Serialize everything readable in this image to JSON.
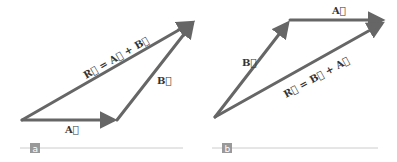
{
  "figure": {
    "panels": [
      {
        "id": "a",
        "tag": "a",
        "vectors": [
          {
            "name": "A",
            "label": "A⃗",
            "from": [
              22,
              120
            ],
            "to": [
              117,
              120
            ]
          },
          {
            "name": "B",
            "label": "B⃗",
            "from": [
              117,
              120
            ],
            "to": [
              195,
              20
            ]
          },
          {
            "name": "R",
            "label": "R⃗ = A⃗ + B⃗",
            "from": [
              22,
              120
            ],
            "to": [
              195,
              20
            ]
          }
        ],
        "equation": "R⃗ = A⃗ + B⃗"
      },
      {
        "id": "b",
        "tag": "b",
        "vectors": [
          {
            "name": "B",
            "label": "B⃗",
            "from": [
              215,
              117
            ],
            "to": [
              290,
              20
            ]
          },
          {
            "name": "A",
            "label": "A⃗",
            "from": [
              290,
              20
            ],
            "to": [
              385,
              20
            ]
          },
          {
            "name": "R",
            "label": "R⃗ = B⃗ + A⃗",
            "from": [
              215,
              117
            ],
            "to": [
              385,
              22
            ]
          }
        ],
        "equation": "R⃗ = B⃗ + A⃗"
      }
    ],
    "colors": {
      "vector": "#666666",
      "label": "#333333",
      "tag_bg": "#999999",
      "rule": "#cccccc"
    }
  }
}
